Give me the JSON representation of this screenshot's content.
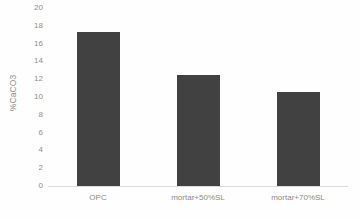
{
  "chart_data": {
    "type": "bar",
    "title": "",
    "xlabel": "",
    "ylabel": "%CaCO3",
    "categories": [
      "OPC",
      "mortar+50%SL",
      "mortar+70%SL"
    ],
    "values": [
      17.3,
      12.5,
      10.6
    ],
    "ylim": [
      0,
      20
    ],
    "ytick_step": 2,
    "yticks": [
      "20",
      "18",
      "16",
      "14",
      "12",
      "10",
      "8",
      "6",
      "4",
      "2",
      "0"
    ],
    "grid": false,
    "legend": false,
    "series": [
      {
        "name": "%CaCO3",
        "values": [
          17.3,
          12.5,
          10.6
        ],
        "color": "#414141"
      }
    ]
  },
  "colors": {
    "bar": "#414141",
    "axis_line": "#dcdcdc",
    "tick_text": "#8f8f8f",
    "background": "#fefefe"
  }
}
